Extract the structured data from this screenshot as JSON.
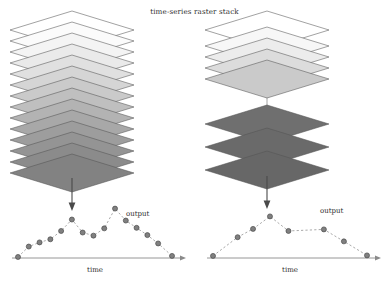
{
  "figure": {
    "title": "time-series raster stack",
    "width": 389,
    "height": 284
  },
  "style": {
    "background": "#ffffff",
    "layer_stroke": "#555555",
    "axis_color": "#8a8a8a",
    "point_fill": "#808080",
    "point_stroke": "#4a4a4a",
    "line_color": "#9a9a9a",
    "arrow_color": "#4a4a4a",
    "spindle_color": "#9a9a9a",
    "text_color": "#2e2e2e"
  },
  "panels": [
    {
      "id": "left",
      "name": "dense-regular-stack",
      "stack": {
        "name": "raster-layer-stack",
        "layer_count": 14,
        "spindle": true,
        "layers": [
          {
            "index": 0,
            "fill": "#ffffff",
            "y": 30
          },
          {
            "index": 1,
            "fill": "#fbfbfb",
            "y": 41
          },
          {
            "index": 2,
            "fill": "#f4f4f4",
            "y": 52
          },
          {
            "index": 3,
            "fill": "#eaeaea",
            "y": 63
          },
          {
            "index": 4,
            "fill": "#e0e0e0",
            "y": 74
          },
          {
            "index": 5,
            "fill": "#d5d5d5",
            "y": 85
          },
          {
            "index": 6,
            "fill": "#cacaca",
            "y": 96
          },
          {
            "index": 7,
            "fill": "#bfbfbf",
            "y": 107
          },
          {
            "index": 8,
            "fill": "#b3b3b3",
            "y": 118
          },
          {
            "index": 9,
            "fill": "#a8a8a8",
            "y": 129
          },
          {
            "index": 10,
            "fill": "#9d9d9d",
            "y": 140
          },
          {
            "index": 11,
            "fill": "#949494",
            "y": 151
          },
          {
            "index": 12,
            "fill": "#8b8b8b",
            "y": 162
          },
          {
            "index": 13,
            "fill": "#828282",
            "y": 173
          }
        ]
      },
      "arrow": {
        "name": "flow-arrow-down"
      },
      "chart": {
        "type": "scatter",
        "xlabel": "time",
        "series_label": "output",
        "point_count": 15,
        "x": [
          0.0,
          0.07,
          0.14,
          0.21,
          0.28,
          0.35,
          0.42,
          0.49,
          0.56,
          0.63,
          0.7,
          0.77,
          0.84,
          0.91,
          1.0
        ],
        "y": [
          0.02,
          0.22,
          0.3,
          0.36,
          0.52,
          0.74,
          0.49,
          0.43,
          0.57,
          0.95,
          0.72,
          0.58,
          0.44,
          0.28,
          0.04
        ],
        "xlim": [
          0,
          1
        ],
        "ylim": [
          0,
          1
        ],
        "grid": false,
        "connected": true,
        "line_style": "dashed"
      }
    },
    {
      "id": "right",
      "name": "sparse-irregular-stack",
      "stack": {
        "name": "raster-layer-stack",
        "layer_count": 8,
        "spindle": true,
        "gap_after_index": 4,
        "layers": [
          {
            "index": 0,
            "fill": "#ffffff",
            "y": 30
          },
          {
            "index": 1,
            "fill": "#f7f7f7",
            "y": 46
          },
          {
            "index": 2,
            "fill": "#ececec",
            "y": 57
          },
          {
            "index": 3,
            "fill": "#dcdcdc",
            "y": 68
          },
          {
            "index": 4,
            "fill": "#cacaca",
            "y": 79
          },
          {
            "index": 5,
            "fill": "#6f6f6f",
            "y": 124
          },
          {
            "index": 6,
            "fill": "#6a6a6a",
            "y": 147
          },
          {
            "index": 7,
            "fill": "#676767",
            "y": 170
          }
        ]
      },
      "arrow": {
        "name": "flow-arrow-down"
      },
      "chart": {
        "type": "scatter",
        "xlabel": "time",
        "series_label": "output",
        "point_count": 8,
        "x": [
          0.0,
          0.16,
          0.26,
          0.37,
          0.49,
          0.72,
          0.85,
          1.0
        ],
        "y": [
          0.04,
          0.4,
          0.56,
          0.8,
          0.52,
          0.55,
          0.32,
          0.05
        ],
        "xlim": [
          0,
          1
        ],
        "ylim": [
          0,
          1
        ],
        "grid": false,
        "connected": true,
        "line_style": "dashed"
      }
    }
  ]
}
